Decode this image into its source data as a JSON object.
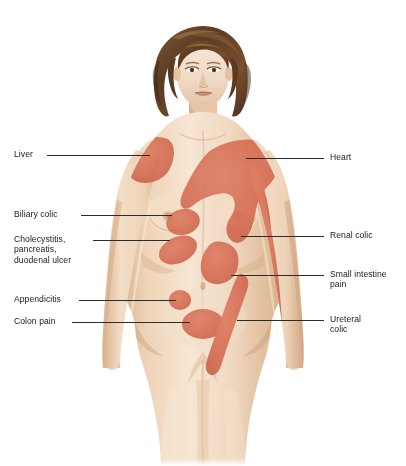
{
  "background_color": "#ffffff",
  "palette": {
    "pain_region": "#d4694f",
    "pain_region_soft": "#cf6b52",
    "skin_light": "#f2dcc6",
    "skin_mid": "#e8c9ab",
    "skin_shadow": "#d9b392",
    "skin_deep": "#c59a78",
    "hair_dark": "#4a3020",
    "hair_mid": "#6e4a2d",
    "hair_light": "#9a7049",
    "leader_line": "#2b2b2b",
    "text": "#1a1a1a"
  },
  "labels": {
    "left": [
      {
        "id": "liver",
        "text": "Liver",
        "text_x": 14,
        "text_y": 149,
        "line_x1": 47,
        "line_x2": 150,
        "line_y": 155
      },
      {
        "id": "biliary-colic",
        "text": "Biliary colic",
        "text_x": 14,
        "text_y": 209,
        "line_x1": 81,
        "line_x2": 172,
        "line_y": 215
      },
      {
        "id": "cholecystitis",
        "text": "Cholecystitis,\npancreatis,\nduodenal ulcer",
        "text_x": 14,
        "text_y": 234,
        "line_x1": 93,
        "line_x2": 170,
        "line_y": 240
      },
      {
        "id": "appendicitis",
        "text": "Appendicitis",
        "text_x": 14,
        "text_y": 294,
        "line_x1": 79,
        "line_x2": 176,
        "line_y": 300
      },
      {
        "id": "colon-pain",
        "text": "Colon pain",
        "text_x": 14,
        "text_y": 316,
        "line_x1": 72,
        "line_x2": 190,
        "line_y": 322
      }
    ],
    "right": [
      {
        "id": "heart",
        "text": "Heart",
        "text_x": 330,
        "text_y": 152,
        "line_x1": 246,
        "line_x2": 324,
        "line_y": 158
      },
      {
        "id": "renal-colic",
        "text": "Renal colic",
        "text_x": 330,
        "text_y": 230,
        "line_x1": 241,
        "line_x2": 324,
        "line_y": 236
      },
      {
        "id": "small-intestine",
        "text": "Small intestine\npain",
        "text_x": 330,
        "text_y": 269,
        "line_x1": 231,
        "line_x2": 324,
        "line_y": 275
      },
      {
        "id": "ureteral-colic",
        "text": "Ureteral\ncolic",
        "text_x": 330,
        "text_y": 314,
        "line_x1": 237,
        "line_x2": 324,
        "line_y": 320
      }
    ]
  },
  "pain_regions": [
    {
      "id": "liver-region",
      "label": "Liver",
      "location": "right shoulder / upper chest (viewer left)"
    },
    {
      "id": "heart-region",
      "label": "Heart",
      "location": "left chest sweeping over breast to arm (viewer right)"
    },
    {
      "id": "biliary-colic-region",
      "label": "Biliary colic",
      "location": "right upper abdomen below breast"
    },
    {
      "id": "cholecystitis-region",
      "label": "Cholecystitis, pancreatis, duodenal ulcer",
      "location": "right mid abdomen / epigastric"
    },
    {
      "id": "renal-colic-region",
      "label": "Renal colic",
      "location": "inner left arm stripe"
    },
    {
      "id": "small-intestine-region",
      "label": "Small intestine pain",
      "location": "periumbilical mid abdomen"
    },
    {
      "id": "appendicitis-region",
      "label": "Appendicitis",
      "location": "right lower quadrant small circle"
    },
    {
      "id": "colon-pain-region",
      "label": "Colon pain",
      "location": "lower central abdomen oval"
    },
    {
      "id": "ureteral-colic-region",
      "label": "Ureteral colic",
      "location": "left groin to inner thigh diagonal stripe"
    }
  ]
}
